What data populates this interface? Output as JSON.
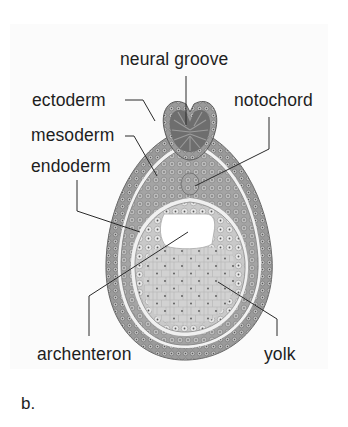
{
  "figure": {
    "panel_letter": "b.",
    "labels": {
      "neural_groove": "neural groove",
      "ectoderm": "ectoderm",
      "mesoderm": "mesoderm",
      "endoderm": "endoderm",
      "notochord": "notochord",
      "archenteron": "archenteron",
      "yolk": "yolk"
    },
    "colors": {
      "ectoderm": "#8e8e8e",
      "mesoderm": "#9c9c9c",
      "endoderm": "#d6d6d6",
      "yolk": "#dcdcdc",
      "neural_tissue": "#6e6e6e",
      "cavity": "#ffffff",
      "leader_line": "#2a2a2a"
    }
  }
}
